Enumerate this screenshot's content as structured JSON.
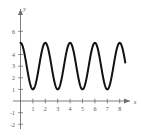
{
  "chart_data": {
    "type": "line",
    "title": "",
    "subtitle": "",
    "xlabel": "x",
    "ylabel": "y",
    "xlim": [
      -0.55,
      9.0
    ],
    "ylim": [
      -2.6,
      7.2
    ],
    "grid": false,
    "legend": null,
    "x_ticks": [
      1,
      2,
      3,
      4,
      5,
      6,
      7,
      8
    ],
    "x_tick_labels": [
      "1",
      "2",
      "3",
      "4",
      "5",
      "6",
      "7",
      "8"
    ],
    "y_ticks": [
      -2,
      -1,
      1,
      2,
      3,
      4,
      6
    ],
    "y_tick_labels": [
      "-2",
      "-1",
      "1",
      "2",
      "3",
      "4",
      "6"
    ],
    "x_axis_arrow": true,
    "y_axis_arrow": true,
    "series": [
      {
        "name": "oscillating curve",
        "color": "#111111",
        "amplitude": 2,
        "midline": 3,
        "period": 2,
        "minimum": 1,
        "maximum": 5,
        "x_start": 0,
        "x_end": 8.45,
        "peaks_x": [
          0,
          2,
          4,
          6,
          8
        ],
        "troughs_x": [
          1,
          3,
          5,
          7
        ],
        "x": [
          0,
          0.25,
          0.5,
          0.75,
          1,
          1.25,
          1.5,
          1.75,
          2,
          2.25,
          2.5,
          2.75,
          3,
          3.25,
          3.5,
          3.75,
          4,
          4.25,
          4.5,
          4.75,
          5,
          5.25,
          5.5,
          5.75,
          6,
          6.25,
          6.5,
          6.75,
          7,
          7.25,
          7.5,
          7.75,
          8,
          8.25,
          8.45
        ],
        "values": [
          5,
          4.41,
          3,
          1.59,
          1,
          1.59,
          3,
          4.41,
          5,
          4.41,
          3,
          1.59,
          1,
          1.59,
          3,
          4.41,
          5,
          4.41,
          3,
          1.59,
          1,
          1.59,
          3,
          4.41,
          5,
          4.41,
          3,
          1.59,
          1,
          1.59,
          3,
          4.41,
          5,
          4.41,
          3.33
        ]
      }
    ]
  },
  "axes": {
    "x_name": "x",
    "y_name": "y"
  },
  "colors": {
    "curve": "#111111",
    "axis": "#6e6e70",
    "label": "#58585a",
    "background": "#ffffff"
  }
}
